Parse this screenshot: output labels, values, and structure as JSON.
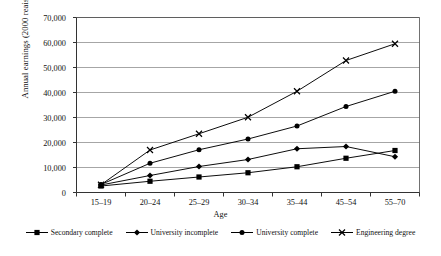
{
  "chart_data": {
    "type": "line",
    "title": "",
    "xlabel": "Age",
    "ylabel": "Annual earnings (2000 reais)",
    "categories": [
      "15–19",
      "20–24",
      "25–29",
      "30–34",
      "35–44",
      "45–54",
      "55–70"
    ],
    "ylim": [
      0,
      70000
    ],
    "y_ticks": [
      0,
      10000,
      20000,
      30000,
      40000,
      50000,
      60000,
      70000
    ],
    "y_tick_labels": [
      "0",
      "10,000",
      "20,000",
      "30,000",
      "40,000",
      "50,000",
      "60,000",
      "70,000"
    ],
    "grid": true,
    "legend_position": "bottom",
    "series": [
      {
        "name": "Secondary complete",
        "marker": "square",
        "values": [
          2600,
          4500,
          6200,
          7900,
          10300,
          13700,
          16800
        ]
      },
      {
        "name": "University incomplete",
        "marker": "diamond",
        "values": [
          3000,
          6800,
          10400,
          13200,
          17500,
          18400,
          14300
        ]
      },
      {
        "name": "University complete",
        "marker": "circle",
        "values": [
          3200,
          11700,
          17100,
          21400,
          26600,
          34400,
          40500
        ]
      },
      {
        "name": "Engineering degree",
        "marker": "cross",
        "values": [
          3100,
          17000,
          23500,
          30100,
          40500,
          52800,
          59500
        ]
      }
    ],
    "colors": {
      "line": "#000000",
      "grid": "#808080",
      "axis": "#4d4d4d",
      "background": "#ffffff"
    }
  }
}
